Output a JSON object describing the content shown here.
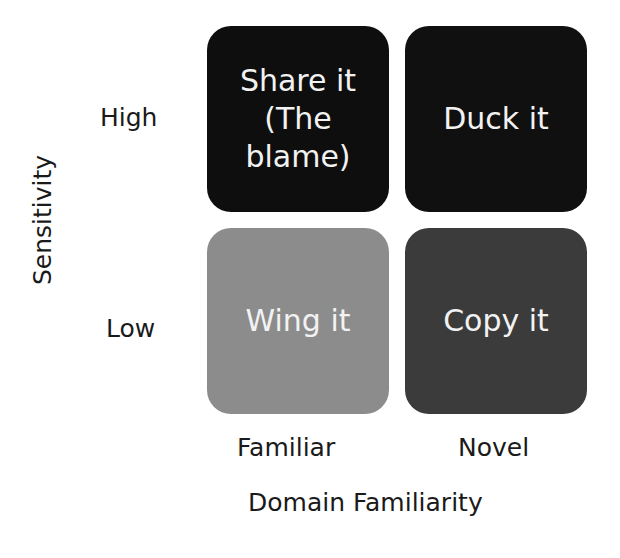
{
  "matrix": {
    "y_axis_title": "Sensitivity",
    "x_axis_title": "Domain Familiarity",
    "rows": [
      "High",
      "Low"
    ],
    "columns": [
      "Familiar",
      "Novel"
    ],
    "cells": {
      "high_familiar": "Share it\n(The\nblame)",
      "high_novel": "Duck it",
      "low_familiar": "Wing it",
      "low_novel": "Copy it"
    },
    "colors": {
      "high_familiar": "#0e0e0e",
      "high_novel": "#101010",
      "low_familiar": "#8c8c8c",
      "low_novel": "#3b3b3b"
    }
  }
}
